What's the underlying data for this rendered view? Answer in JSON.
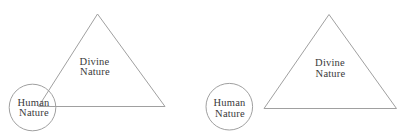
{
  "colors": {
    "background": "#ffffff",
    "line": "#a0a0a0",
    "text": "#3a3a3a"
  },
  "diagrams": [
    {
      "triangle_label": {
        "line1": "Divine",
        "line2": "Nature"
      },
      "circle_label": {
        "line1": "Human",
        "line2": "Nature"
      }
    },
    {
      "triangle_label": {
        "line1": "Divine",
        "line2": "Nature"
      },
      "circle_label": {
        "line1": "Human",
        "line2": "Nature"
      }
    }
  ]
}
